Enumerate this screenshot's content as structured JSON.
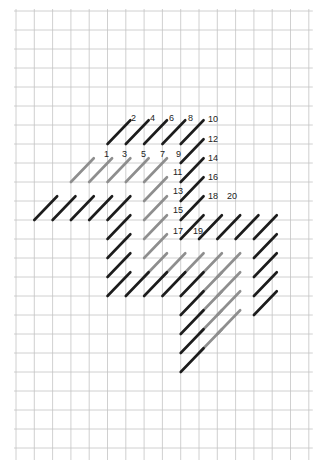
{
  "diagram": {
    "title": "",
    "grid": {
      "cols": 16,
      "rows": 23,
      "origin_x": 16,
      "origin_y": 11,
      "cell_w": 18.3,
      "cell_h": 19.0,
      "line_color": "#c4c4c4",
      "overshoot_bottom_px": 12
    },
    "stitch_span": 1.25,
    "colors": {
      "dark": "#1c1c1c",
      "light": "#8e8e8e"
    },
    "labels": [
      {
        "text": "1",
        "x": 104,
        "y": 157
      },
      {
        "text": "2",
        "x": 131,
        "y": 121
      },
      {
        "text": "3",
        "x": 122,
        "y": 157
      },
      {
        "text": "4",
        "x": 150,
        "y": 121
      },
      {
        "text": "5",
        "x": 141,
        "y": 157
      },
      {
        "text": "6",
        "x": 169,
        "y": 121
      },
      {
        "text": "7",
        "x": 160,
        "y": 157
      },
      {
        "text": "8",
        "x": 188,
        "y": 121
      },
      {
        "text": "9",
        "x": 176,
        "y": 157
      },
      {
        "text": "10",
        "x": 208,
        "y": 122
      },
      {
        "text": "11",
        "x": 173,
        "y": 175
      },
      {
        "text": "12",
        "x": 208,
        "y": 142
      },
      {
        "text": "13",
        "x": 173,
        "y": 194
      },
      {
        "text": "14",
        "x": 208,
        "y": 161
      },
      {
        "text": "15",
        "x": 173,
        "y": 213
      },
      {
        "text": "16",
        "x": 208,
        "y": 180
      },
      {
        "text": "17",
        "x": 173,
        "y": 234
      },
      {
        "text": "18",
        "x": 208,
        "y": 199
      },
      {
        "text": "19",
        "x": 193,
        "y": 234
      },
      {
        "text": "20",
        "x": 227,
        "y": 199
      }
    ],
    "stitches": [
      {
        "c": 5,
        "r": 7,
        "tone": "dark"
      },
      {
        "c": 6,
        "r": 7,
        "tone": "dark"
      },
      {
        "c": 7,
        "r": 7,
        "tone": "dark"
      },
      {
        "c": 8,
        "r": 7,
        "tone": "dark"
      },
      {
        "c": 9,
        "r": 7,
        "tone": "dark"
      },
      {
        "c": 9,
        "r": 8,
        "tone": "dark"
      },
      {
        "c": 9,
        "r": 9,
        "tone": "dark"
      },
      {
        "c": 9,
        "r": 10,
        "tone": "dark"
      },
      {
        "c": 9,
        "r": 11,
        "tone": "dark"
      },
      {
        "c": 9,
        "r": 12,
        "tone": "dark"
      },
      {
        "c": 10,
        "r": 12,
        "tone": "dark"
      },
      {
        "c": 11,
        "r": 12,
        "tone": "dark"
      },
      {
        "c": 12,
        "r": 12,
        "tone": "dark"
      },
      {
        "c": 13,
        "r": 12,
        "tone": "dark"
      },
      {
        "c": 3,
        "r": 9,
        "tone": "light"
      },
      {
        "c": 4,
        "r": 9,
        "tone": "light"
      },
      {
        "c": 5,
        "r": 9,
        "tone": "light"
      },
      {
        "c": 6,
        "r": 9,
        "tone": "light"
      },
      {
        "c": 7,
        "r": 9,
        "tone": "light"
      },
      {
        "c": 7,
        "r": 10,
        "tone": "light"
      },
      {
        "c": 7,
        "r": 11,
        "tone": "light"
      },
      {
        "c": 7,
        "r": 12,
        "tone": "light"
      },
      {
        "c": 7,
        "r": 13,
        "tone": "light"
      },
      {
        "c": 7,
        "r": 14,
        "tone": "light"
      },
      {
        "c": 8,
        "r": 14,
        "tone": "light"
      },
      {
        "c": 9,
        "r": 14,
        "tone": "light"
      },
      {
        "c": 10,
        "r": 14,
        "tone": "light"
      },
      {
        "c": 11,
        "r": 14,
        "tone": "light"
      },
      {
        "c": 11,
        "r": 15,
        "tone": "light"
      },
      {
        "c": 11,
        "r": 16,
        "tone": "light"
      },
      {
        "c": 11,
        "r": 17,
        "tone": "light"
      },
      {
        "c": 10,
        "r": 15,
        "tone": "light"
      },
      {
        "c": 10,
        "r": 16,
        "tone": "light"
      },
      {
        "c": 10,
        "r": 17,
        "tone": "light"
      },
      {
        "c": 10,
        "r": 18,
        "tone": "light"
      },
      {
        "c": 1,
        "r": 11,
        "tone": "dark"
      },
      {
        "c": 2,
        "r": 11,
        "tone": "dark"
      },
      {
        "c": 3,
        "r": 11,
        "tone": "dark"
      },
      {
        "c": 4,
        "r": 11,
        "tone": "dark"
      },
      {
        "c": 5,
        "r": 11,
        "tone": "dark"
      },
      {
        "c": 5,
        "r": 12,
        "tone": "dark"
      },
      {
        "c": 5,
        "r": 13,
        "tone": "dark"
      },
      {
        "c": 5,
        "r": 14,
        "tone": "dark"
      },
      {
        "c": 5,
        "r": 15,
        "tone": "dark"
      },
      {
        "c": 6,
        "r": 15,
        "tone": "dark"
      },
      {
        "c": 7,
        "r": 15,
        "tone": "dark"
      },
      {
        "c": 8,
        "r": 15,
        "tone": "dark"
      },
      {
        "c": 9,
        "r": 15,
        "tone": "dark"
      },
      {
        "c": 9,
        "r": 16,
        "tone": "dark"
      },
      {
        "c": 9,
        "r": 17,
        "tone": "dark"
      },
      {
        "c": 9,
        "r": 18,
        "tone": "dark"
      },
      {
        "c": 9,
        "r": 19,
        "tone": "dark"
      },
      {
        "c": 13,
        "r": 13,
        "tone": "dark"
      },
      {
        "c": 13,
        "r": 14,
        "tone": "dark"
      },
      {
        "c": 13,
        "r": 15,
        "tone": "dark"
      },
      {
        "c": 13,
        "r": 16,
        "tone": "dark"
      }
    ]
  }
}
